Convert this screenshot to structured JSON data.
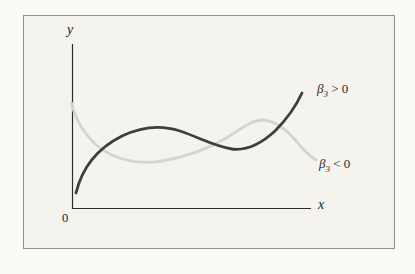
{
  "figure": {
    "background_outer": "#fbfaf7",
    "background_inner": "#f4f3ee",
    "frame_border_color": "#8f8f8d"
  },
  "axis_labels": {
    "y": "y",
    "x": "x",
    "origin": "0"
  },
  "curve_labels": {
    "positive": {
      "beta": "β",
      "sub": "3",
      "rest": " > 0"
    },
    "negative": {
      "beta": "β",
      "sub": "3",
      "rest": " < 0"
    }
  },
  "colors": {
    "curve_positive": "#3e3e3e",
    "curve_negative": "#d5d4d0",
    "axis": "#2b2b2b"
  },
  "paths": {
    "beta_positive": "M 76 193 C 82 168 98 148 122 136 C 143 126 162 125 180 131 C 198 137 214 146 232 149 C 248 151 262 143 275 131 C 287 119 296 106 302 93",
    "beta_negative": "M 71.5 103 C 77 126 92 146 112 155 C 128 162 146 164 162 161 C 186 157 208 149 228 137 C 242 128 252 120 263 120 C 276 121 287 130 297 142 C 304 151 310 156 316 160",
    "y_axis": "M 72.5 44 L 72.5 209",
    "x_axis": "M 72.5 208.5 L 311 208.5"
  },
  "chart_data": {
    "type": "line",
    "title": "",
    "xlabel": "x",
    "ylabel": "y",
    "origin_label": "0",
    "axes": "qualitative sketch, no ticks or gridlines, axes meet at labeled origin 0",
    "legend_position": "labels placed at right ends of curves",
    "series": [
      {
        "name": "β3 > 0",
        "style": "dark solid curve",
        "color": "#3e3e3e",
        "shape": "cubic with positive leading coefficient: rises steeply from near origin, local maximum, shallow local minimum, then rises steeply",
        "points_normalized": [
          [
            0.015,
            0.09
          ],
          [
            0.1,
            0.3
          ],
          [
            0.21,
            0.44
          ],
          [
            0.36,
            0.5
          ],
          [
            0.52,
            0.4
          ],
          [
            0.69,
            0.36
          ],
          [
            0.82,
            0.44
          ],
          [
            0.92,
            0.58
          ],
          [
            0.96,
            0.7
          ]
        ]
      },
      {
        "name": "β3 < 0",
        "style": "light gray solid curve",
        "color": "#d5d4d0",
        "shape": "cubic with negative leading coefficient: falls from high on y-axis, local minimum, local maximum, then falls",
        "points_normalized": [
          [
            0.0,
            0.64
          ],
          [
            0.09,
            0.42
          ],
          [
            0.17,
            0.33
          ],
          [
            0.35,
            0.28
          ],
          [
            0.56,
            0.39
          ],
          [
            0.7,
            0.52
          ],
          [
            0.79,
            0.54
          ],
          [
            0.9,
            0.43
          ],
          [
            1.02,
            0.3
          ]
        ]
      }
    ]
  }
}
